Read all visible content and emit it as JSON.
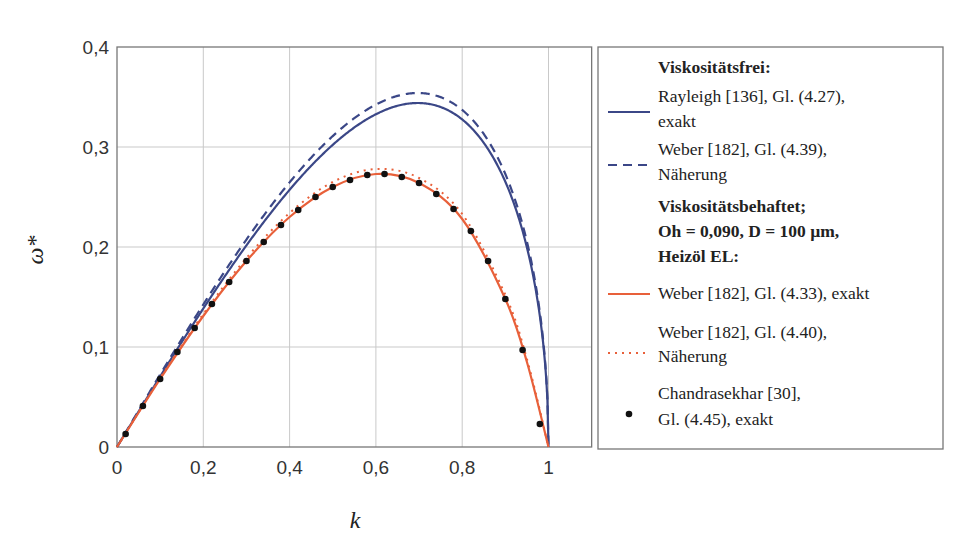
{
  "chart_data": {
    "type": "line",
    "title": "",
    "xlabel": "k",
    "ylabel": "ω*",
    "xlim": [
      0,
      1.1
    ],
    "ylim": [
      0,
      0.4
    ],
    "xticks": [
      0,
      0.2,
      0.4,
      0.6,
      0.8,
      1
    ],
    "xtick_labels": [
      "0",
      "0,2",
      "0,4",
      "0,6",
      "0,8",
      "1"
    ],
    "yticks": [
      0,
      0.1,
      0.2,
      0.3,
      0.4
    ],
    "ytick_labels": [
      "0",
      "0,1",
      "0,2",
      "0,3",
      "0,4"
    ],
    "grid": true,
    "legend_position": "right, outside",
    "legend_groups": [
      {
        "heading": [
          "Viskositätsfrei:"
        ]
      },
      {
        "heading": [
          "Viskositätsbehaftet;",
          "Oh = 0,090, D = 100 µm,",
          "Heizöl EL:"
        ]
      }
    ],
    "series": [
      {
        "name": "Rayleigh [136], Gl. (4.27), exakt",
        "label_lines": [
          "Rayleigh [136], Gl. (4.27),",
          "exakt"
        ],
        "group": 0,
        "style": "solid",
        "color": "#3b4787",
        "x": [
          0,
          0.1,
          0.2,
          0.3,
          0.4,
          0.5,
          0.6,
          0.7,
          0.8,
          0.9,
          0.95,
          0.99,
          1.0
        ],
        "values": [
          0,
          0.07,
          0.137,
          0.199,
          0.254,
          0.299,
          0.331,
          0.344,
          0.326,
          0.247,
          0.178,
          0.081,
          0
        ]
      },
      {
        "name": "Weber [182], Gl. (4.39), Näherung",
        "label_lines": [
          "Weber [182], Gl. (4.39),",
          "Näherung"
        ],
        "group": 0,
        "style": "dashed",
        "color": "#3b4787",
        "x": [
          0,
          0.1,
          0.2,
          0.3,
          0.4,
          0.5,
          0.6,
          0.7,
          0.8,
          0.9,
          0.95,
          0.99,
          1.0
        ],
        "values": [
          0,
          0.071,
          0.139,
          0.202,
          0.259,
          0.306,
          0.34,
          0.354,
          0.337,
          0.257,
          0.186,
          0.085,
          0
        ]
      },
      {
        "name": "Weber [182], Gl. (4.33), exakt",
        "label_lines": [
          "Weber [182], Gl. (4.33), exakt"
        ],
        "group": 1,
        "style": "solid",
        "color": "#e8603a",
        "x": [
          0,
          0.1,
          0.2,
          0.3,
          0.4,
          0.5,
          0.6,
          0.7,
          0.8,
          0.9,
          0.95,
          1.0
        ],
        "values": [
          0,
          0.068,
          0.131,
          0.186,
          0.23,
          0.26,
          0.273,
          0.264,
          0.228,
          0.148,
          0.085,
          0
        ]
      },
      {
        "name": "Weber [182], Gl. (4.40), Näherung",
        "label_lines": [
          "Weber [182], Gl. (4.40),",
          "Näherung"
        ],
        "group": 1,
        "style": "dotted",
        "color": "#e8603a",
        "x": [
          0,
          0.1,
          0.2,
          0.3,
          0.4,
          0.5,
          0.6,
          0.7,
          0.8,
          0.9,
          0.95,
          1.0
        ],
        "values": [
          0,
          0.069,
          0.133,
          0.189,
          0.234,
          0.265,
          0.278,
          0.269,
          0.233,
          0.152,
          0.088,
          0
        ]
      },
      {
        "name": "Chandrasekhar [30], Gl. (4.45), exakt",
        "label_lines": [
          "Chandrasekhar [30],",
          "Gl. (4.45), exakt"
        ],
        "group": 1,
        "style": "markers",
        "color": "#111111",
        "x": [
          0.02,
          0.06,
          0.1,
          0.14,
          0.18,
          0.22,
          0.26,
          0.3,
          0.34,
          0.38,
          0.42,
          0.46,
          0.5,
          0.54,
          0.58,
          0.62,
          0.66,
          0.7,
          0.74,
          0.78,
          0.82,
          0.86,
          0.9,
          0.94,
          0.98
        ],
        "values": [
          0.013,
          0.041,
          0.068,
          0.095,
          0.119,
          0.143,
          0.165,
          0.186,
          0.205,
          0.222,
          0.237,
          0.25,
          0.26,
          0.267,
          0.272,
          0.273,
          0.27,
          0.264,
          0.253,
          0.238,
          0.216,
          0.186,
          0.148,
          0.097,
          0.023
        ]
      }
    ]
  },
  "colors": {
    "blue": "#3b4787",
    "orange": "#e8603a",
    "grid": "#c9c9c9",
    "axis": "#777777",
    "marker": "#111111"
  }
}
